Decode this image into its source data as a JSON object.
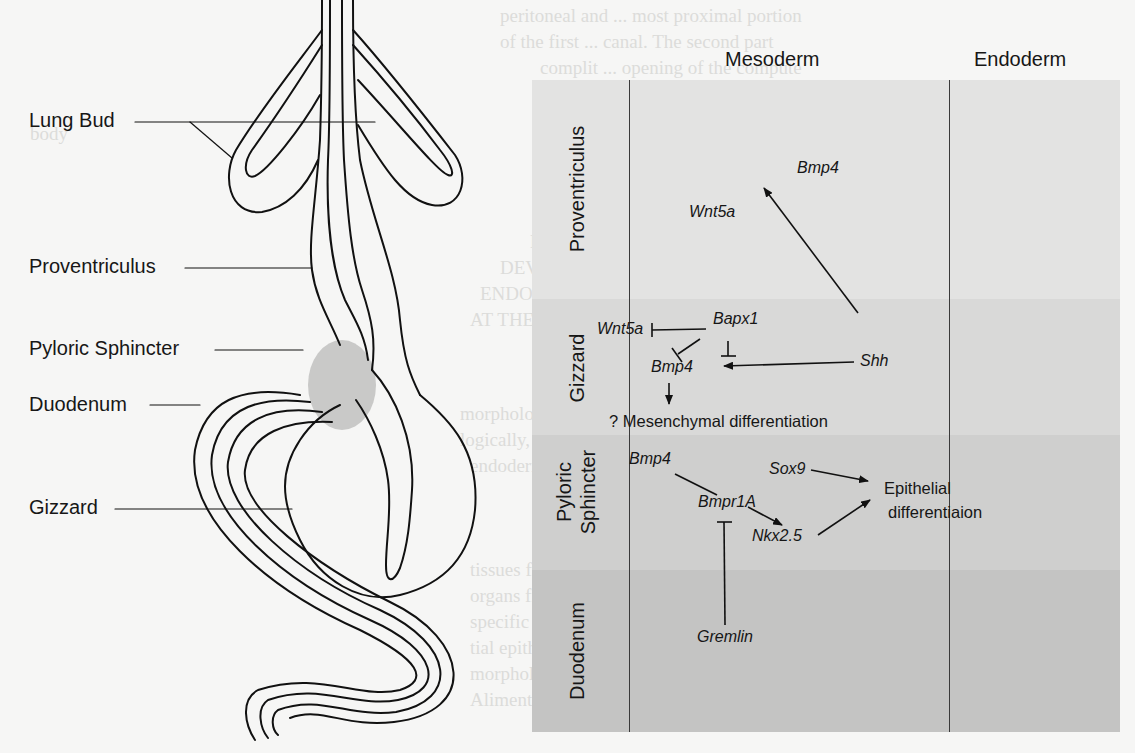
{
  "anatomy": {
    "labels": [
      {
        "text": "Lung Bud"
      },
      {
        "text": "Proventriculus"
      },
      {
        "text": "Pyloric Sphincter"
      },
      {
        "text": "Duodenum"
      },
      {
        "text": "Gizzard"
      }
    ]
  },
  "diagram": {
    "columns": [
      {
        "label": "Mesoderm"
      },
      {
        "label": "Endoderm"
      }
    ],
    "rows": [
      {
        "label": "Proventriculus",
        "color": "#e3e3e2"
      },
      {
        "label": "Gizzard",
        "color": "#d9d9d8"
      },
      {
        "label": "Pyloric Sphincter",
        "label_line1": "Pyloric",
        "label_line2": "Sphincter",
        "color": "#cfcfce"
      },
      {
        "label": "Duodenum",
        "color": "#c4c4c3"
      }
    ],
    "nodes": {
      "prov_bmp4": "Bmp4",
      "prov_wnt5a": "Wnt5a",
      "giz_wnt5a": "Wnt5a",
      "giz_bapx1": "Bapx1",
      "giz_bmp4": "Bmp4",
      "shh": "Shh",
      "mesenchymal": "? Mesenchymal differentiation",
      "pyl_bmp4": "Bmp4",
      "bmpr1a": "Bmpr1A",
      "nkx25": "Nkx2.5",
      "sox9": "Sox9",
      "epithelial_line1": "Epithelial",
      "epithelial_line2": "differentiaion",
      "gremlin": "Gremlin"
    },
    "edges": [
      {
        "from": "Shh",
        "to": "Bmp4 (Proventriculus)",
        "type": "activation"
      },
      {
        "from": "Shh",
        "to": "Bmp4 (Gizzard)",
        "type": "activation"
      },
      {
        "from": "Bapx1",
        "to": "Wnt5a (Gizzard)",
        "type": "inhibition"
      },
      {
        "from": "Bapx1",
        "to": "Bmp4 (Gizzard)",
        "type": "inhibition"
      },
      {
        "from": "Bapx1",
        "to": "Shh pathway",
        "type": "inhibition"
      },
      {
        "from": "Bmp4 (Gizzard)",
        "to": "? Mesenchymal differentiation",
        "type": "activation"
      },
      {
        "from": "Bmp4 (Pyloric)",
        "to": "Bmpr1A",
        "type": "binding"
      },
      {
        "from": "Bmpr1A",
        "to": "Nkx2.5",
        "type": "activation"
      },
      {
        "from": "Gremlin",
        "to": "Bmpr1A",
        "type": "inhibition"
      },
      {
        "from": "Sox9",
        "to": "Epithelial differentiaion",
        "type": "activation"
      },
      {
        "from": "Nkx2.5",
        "to": "Epithelial differentiaion",
        "type": "activation"
      }
    ]
  }
}
